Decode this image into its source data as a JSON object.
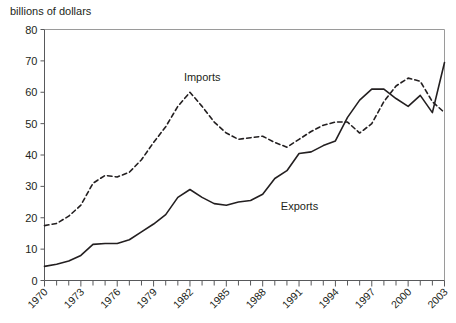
{
  "chart_data": {
    "type": "line",
    "title": "",
    "ylabel": "billions of dollars",
    "xlabel": "",
    "ylim": [
      0,
      80
    ],
    "xlim": [
      1970,
      2003
    ],
    "yticks": [
      0,
      10,
      20,
      30,
      40,
      50,
      60,
      70,
      80
    ],
    "xticks": [
      1970,
      1973,
      1976,
      1979,
      1982,
      1985,
      1988,
      1991,
      1994,
      1997,
      2000,
      2003
    ],
    "grid": false,
    "legend_position": "inline-annotations",
    "x": [
      1970,
      1971,
      1972,
      1973,
      1974,
      1975,
      1976,
      1977,
      1978,
      1979,
      1980,
      1981,
      1982,
      1983,
      1984,
      1985,
      1986,
      1987,
      1988,
      1989,
      1990,
      1991,
      1992,
      1993,
      1994,
      1995,
      1996,
      1997,
      1998,
      1999,
      2000,
      2001,
      2002,
      2003
    ],
    "series": [
      {
        "name": "Imports",
        "style": "dashed",
        "color": "#231f20",
        "values": [
          17.5,
          18.2,
          20.5,
          24.0,
          31.0,
          33.5,
          33.0,
          34.5,
          38.5,
          44.0,
          49.0,
          55.5,
          60.0,
          55.5,
          50.5,
          47.0,
          45.0,
          45.5,
          46.0,
          44.0,
          42.5,
          45.0,
          47.5,
          49.5,
          50.5,
          50.5,
          47.0,
          50.0,
          57.0,
          62.0,
          64.5,
          63.5,
          57.0,
          53.5
        ]
      },
      {
        "name": "Exports",
        "style": "solid",
        "color": "#231f20",
        "values": [
          4.5,
          5.2,
          6.2,
          8.0,
          11.5,
          11.8,
          11.8,
          13.0,
          15.5,
          18.0,
          21.0,
          26.5,
          29.0,
          26.5,
          24.5,
          24.0,
          25.0,
          25.5,
          27.5,
          32.5,
          35.0,
          40.5,
          41.0,
          43.0,
          44.5,
          52.0,
          57.5,
          61.0,
          61.0,
          58.0,
          55.5,
          59.0,
          53.5,
          69.5
        ]
      }
    ],
    "annotations": [
      {
        "text": "Imports",
        "x": 1981.5,
        "y": 63.5
      },
      {
        "text": "Exports",
        "x": 1989.5,
        "y": 22.5
      }
    ]
  },
  "axes": {
    "ytick_labels": [
      "0",
      "10",
      "20",
      "30",
      "40",
      "50",
      "60",
      "70",
      "80"
    ],
    "xtick_labels": [
      "1970",
      "1973",
      "1976",
      "1979",
      "1982",
      "1985",
      "1988",
      "1991",
      "1994",
      "1997",
      "2000",
      "2003"
    ]
  }
}
